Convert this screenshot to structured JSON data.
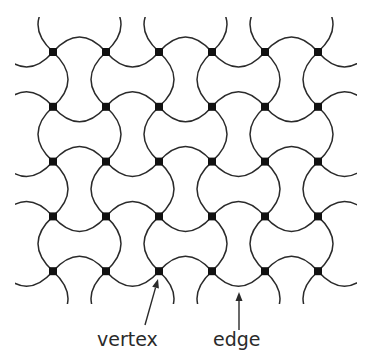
{
  "diagram": {
    "grid": {
      "columns": 6,
      "rows": 5,
      "x0": 53,
      "y0": 52,
      "dx": 53,
      "dy": 54.8,
      "sagitta": 15,
      "clip": {
        "x": 15,
        "y": 17,
        "width": 342,
        "height": 287
      }
    },
    "colors": {
      "stroke": "#2a2a2a",
      "vertex": "#111111",
      "background": "#ffffff"
    },
    "annotations": [
      {
        "label": "vertex",
        "text_x": 97,
        "text_y": 346,
        "arrow_from": [
          145,
          325
        ],
        "arrow_to": [
          158,
          279
        ]
      },
      {
        "label": "edge",
        "text_x": 213,
        "text_y": 346,
        "arrow_from": [
          239,
          330
        ],
        "arrow_to": [
          239,
          292
        ]
      }
    ]
  }
}
